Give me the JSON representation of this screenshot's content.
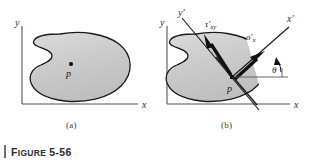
{
  "figure": {
    "caption_prefix": "F",
    "caption_word": "IGURE",
    "caption_number": "5-56",
    "caption_full": "FIGURE 5-56",
    "rule_color": "#6e6e6e"
  },
  "panels": [
    {
      "id": "a",
      "label": "(a)",
      "axes": {
        "x_label": "x",
        "y_label": "y"
      },
      "point_label": "p",
      "body_fill": "#c9c9c9",
      "body_stroke": "#1a1a1a"
    },
    {
      "id": "b",
      "label": "(b)",
      "axes": {
        "x_label": "x",
        "y_label": "y"
      },
      "rotated_axes": {
        "x_prime_label": "x",
        "y_prime_label": "y",
        "prime_mark": "′"
      },
      "point_label": "p",
      "stress_labels": {
        "shear": {
          "symbol": "τ",
          "prime": "′",
          "subscript": "xy"
        },
        "normal": {
          "symbol": "σ",
          "prime": "′",
          "subscript": "x"
        }
      },
      "angle_label": "θ",
      "body_fill": "#c9c9c9",
      "body_stroke": "#1a1a1a",
      "arrow_color": "#111111"
    }
  ],
  "colors": {
    "background": "#ffffff",
    "shape_fill": "#c9c9c9",
    "shape_fill_light": "#d9d9d9",
    "outline": "#1a1a1a",
    "axis": "#555555",
    "text": "#2b2b2b"
  }
}
